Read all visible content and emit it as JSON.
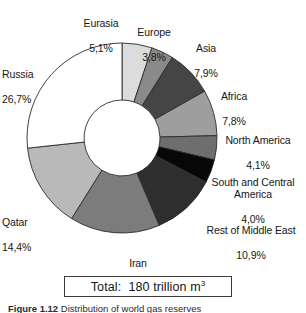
{
  "figure": {
    "total_box_prefix": "Total:",
    "total_box_value": "180 trillion m",
    "total_box_exponent": "3",
    "total_box_full": "Total:  180 trillion m3",
    "caption_label": "Figure 1.12",
    "caption_text": "Distribution of world gas reserves"
  },
  "chart_data": {
    "type": "pie",
    "variant": "donut",
    "title": "",
    "subtitle": "",
    "xlabel": "",
    "ylabel": "",
    "units": "percent",
    "decimal_separator": ",",
    "total_label": "Total:  180 trillion m3",
    "total_value": 180,
    "total_units": "trillion m3",
    "start_angle_deg": 0,
    "direction": "clockwise",
    "inner_radius_ratio": 0.4,
    "legend": "none (direct labels)",
    "grid": false,
    "categories": [
      "Eurasia",
      "Europe",
      "Asia",
      "Africa",
      "North America",
      "South and Central America",
      "Rest of Middle East",
      "Iran",
      "Qatar",
      "Russia"
    ],
    "values": [
      5.1,
      3.8,
      7.9,
      7.8,
      4.1,
      4.0,
      10.9,
      15.3,
      14.4,
      26.7
    ],
    "value_labels": [
      "5,1%",
      "3,8%",
      "7,9%",
      "7,8%",
      "4,1%",
      "4,0%",
      "10,9%",
      "15,3%",
      "14,4%",
      "26,7%"
    ],
    "colors": [
      "#dcdcdc",
      "#8a8a8a",
      "#454545",
      "#9e9e9e",
      "#6e6e6e",
      "#070707",
      "#2e2e2e",
      "#7c7c7c",
      "#b9b9b9",
      "#ffffff"
    ],
    "slices": [
      {
        "name": "Eurasia",
        "value": 5.1,
        "label": "Eurasia",
        "pct": "5,1%",
        "color": "#dcdcdc"
      },
      {
        "name": "Europe",
        "value": 3.8,
        "label": "Europe",
        "pct": "3,8%",
        "color": "#8a8a8a"
      },
      {
        "name": "Asia",
        "value": 7.9,
        "label": "Asia",
        "pct": "7,9%",
        "color": "#454545"
      },
      {
        "name": "Africa",
        "value": 7.8,
        "label": "Africa",
        "pct": "7,8%",
        "color": "#9e9e9e"
      },
      {
        "name": "North America",
        "value": 4.1,
        "label": "North America",
        "pct": "4,1%",
        "color": "#6e6e6e"
      },
      {
        "name": "South and Central America",
        "value": 4.0,
        "label": "South and Central\nAmerica",
        "pct": "4,0%",
        "color": "#070707"
      },
      {
        "name": "Rest of Middle East",
        "value": 10.9,
        "label": "Rest of Middle East",
        "pct": "10,9%",
        "color": "#2e2e2e"
      },
      {
        "name": "Iran",
        "value": 15.3,
        "label": "Iran",
        "pct": "15,3%",
        "color": "#7c7c7c"
      },
      {
        "name": "Qatar",
        "value": 14.4,
        "label": "Qatar",
        "pct": "14,4%",
        "color": "#b9b9b9"
      },
      {
        "name": "Russia",
        "value": 26.7,
        "label": "Russia",
        "pct": "26,7%",
        "color": "#ffffff"
      }
    ]
  }
}
